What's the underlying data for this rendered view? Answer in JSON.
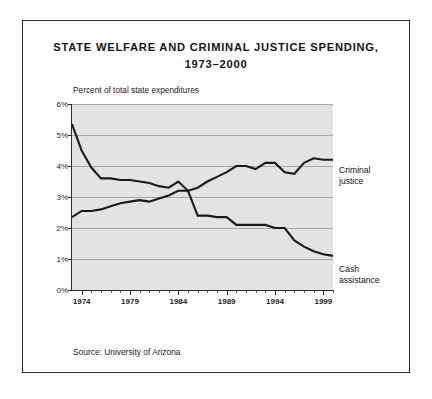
{
  "figure": {
    "title_line1": "STATE WELFARE AND CRIMINAL JUSTICE SPENDING,",
    "title_line2": "1973–2000",
    "axis_title": "Percent of total state expenditures",
    "source": "Source: University of Arizona",
    "label_criminal_justice_line1": "Criminal",
    "label_criminal_justice_line2": "justice",
    "label_cash_assistance_line1": "Cash",
    "label_cash_assistance_line2": "assistance",
    "colors": {
      "plot_background": "#e3e3e3",
      "gridline": "#a7a7a7",
      "line": "#1a1a1a",
      "frame": "#2b2b2b",
      "text": "#1a1a1a"
    }
  },
  "chart_data": {
    "type": "line",
    "title": "STATE WELFARE AND CRIMINAL JUSTICE SPENDING, 1973–2000",
    "xlabel": "",
    "ylabel": "Percent of total state expenditures",
    "xlim": [
      1973,
      2000
    ],
    "ylim": [
      0,
      6
    ],
    "ytick_labels": [
      "0%",
      "1%",
      "2%",
      "3%",
      "4%",
      "5%",
      "6%"
    ],
    "ytick_values": [
      0,
      1,
      2,
      3,
      4,
      5,
      6
    ],
    "xtick_labels": [
      "1974",
      "1979",
      "1984",
      "1989",
      "1994",
      "1999"
    ],
    "xtick_values": [
      1974,
      1979,
      1984,
      1989,
      1994,
      1999
    ],
    "x_minor_tick_interval": 1,
    "grid": "horizontal",
    "legend_position": "right-inline-labels",
    "x": [
      1973,
      1974,
      1975,
      1976,
      1977,
      1978,
      1979,
      1980,
      1981,
      1982,
      1983,
      1984,
      1985,
      1986,
      1987,
      1988,
      1989,
      1990,
      1991,
      1992,
      1993,
      1994,
      1995,
      1996,
      1997,
      1998,
      1999,
      2000
    ],
    "series": [
      {
        "name": "Criminal justice",
        "values": [
          2.35,
          2.55,
          2.55,
          2.6,
          2.7,
          2.8,
          2.85,
          2.9,
          2.85,
          2.95,
          3.05,
          3.2,
          3.2,
          3.3,
          3.5,
          3.65,
          3.8,
          4.0,
          4.0,
          3.9,
          4.1,
          4.1,
          3.8,
          3.75,
          4.1,
          4.25,
          4.2,
          4.2
        ]
      },
      {
        "name": "Cash assistance",
        "values": [
          5.35,
          4.5,
          3.95,
          3.6,
          3.6,
          3.55,
          3.55,
          3.5,
          3.45,
          3.35,
          3.3,
          3.5,
          3.2,
          2.4,
          2.4,
          2.35,
          2.35,
          2.1,
          2.1,
          2.1,
          2.1,
          2.0,
          2.0,
          1.6,
          1.4,
          1.25,
          1.15,
          1.1
        ]
      }
    ]
  }
}
